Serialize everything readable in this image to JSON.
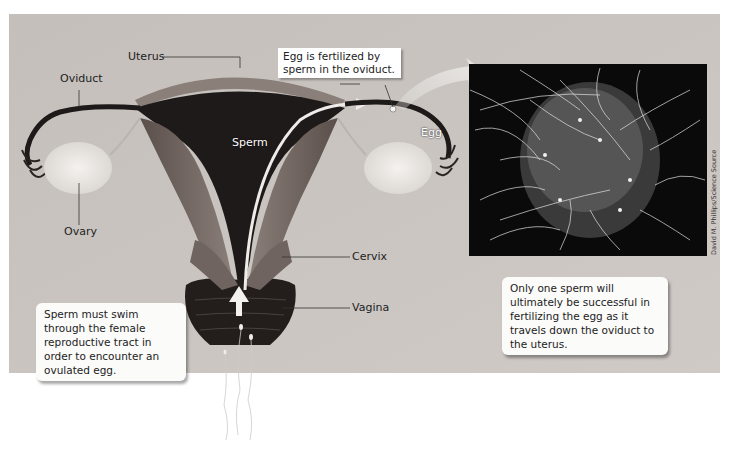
{
  "diagram": {
    "background_color": "#c8c3bf",
    "labels": {
      "uterus": "Uterus",
      "oviduct": "Oviduct",
      "ovary": "Ovary",
      "sperm": "Sperm",
      "egg": "Egg",
      "cervix": "Cervix",
      "vagina": "Vagina"
    },
    "callouts": {
      "fertilized_box": "Egg is fertilized by sperm in the oviduct.",
      "swim_note": "Sperm must swim through the female reproductive tract in order to encounter an ovulated egg.",
      "one_sperm_note": "Only one sperm will ultimately be successful in fertilizing the egg as it travels down the oviduct to the uterus."
    },
    "photo": {
      "description": "Scanning electron micrograph of many sperm surrounding an egg",
      "credit": "David M. Phillips/Science Source"
    }
  }
}
